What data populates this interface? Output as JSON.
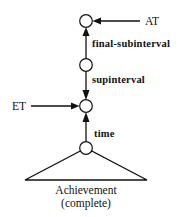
{
  "diagram": {
    "nodes": [
      {
        "id": "top",
        "cx": 86,
        "cy": 21
      },
      {
        "id": "middle",
        "cx": 86,
        "cy": 65
      },
      {
        "id": "et-node",
        "cx": 86,
        "cy": 106
      },
      {
        "id": "bottom",
        "cx": 86,
        "cy": 148
      }
    ],
    "edges": [
      {
        "from": "middle",
        "to": "top",
        "label": "final-subinterval"
      },
      {
        "from": "middle",
        "to": "et-node",
        "label": "supinterval"
      },
      {
        "from": "bottom",
        "to": "et-node",
        "label": "time"
      }
    ],
    "external_pointers": [
      {
        "label": "AT",
        "target": "top"
      },
      {
        "label": "ET",
        "target": "et-node"
      }
    ],
    "triangle": {
      "label_line1": "Achievement",
      "label_line2": "(complete)"
    },
    "colors": {
      "stroke": "#111111",
      "node_fill": "#ffffff",
      "background": "#ffffff"
    }
  }
}
